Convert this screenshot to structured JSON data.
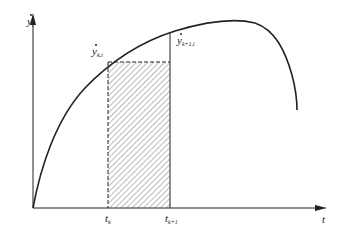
{
  "diagram": {
    "type": "area-under-curve",
    "y_axis_label": "y",
    "y_axis_label_sub": "i",
    "x_axis_label": "t",
    "point_label_left": "y",
    "point_label_left_sub": "k,i",
    "point_label_right": "y",
    "point_label_right_sub": "k+1,i",
    "tick_left": "t",
    "tick_left_sub": "k",
    "tick_right": "t",
    "tick_right_sub": "k+1",
    "colors": {
      "stroke": "#222222",
      "hatch": "#555555",
      "background": "#ffffff"
    }
  }
}
